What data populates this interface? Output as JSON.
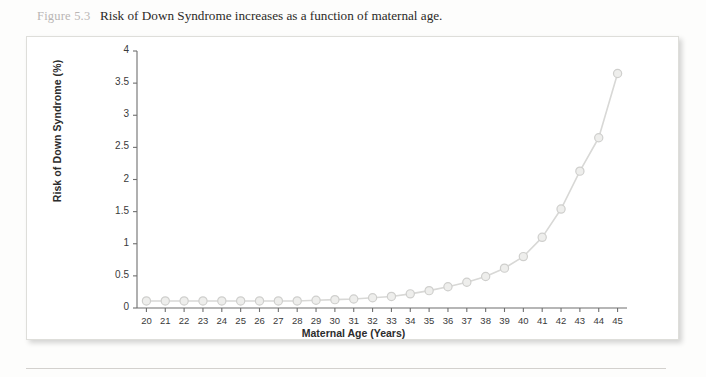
{
  "caption": {
    "figure_number": "Figure 5.3",
    "text": "Risk of Down Syndrome increases as a function of maternal age."
  },
  "colors": {
    "line": "#d8d8d6",
    "marker_fill": "#eeeeec",
    "marker_stroke": "#cfcfcd",
    "axis": "#6f6f6f",
    "text": "#2c2c2c",
    "panel_border": "#dededa",
    "figure_number": "#b9b6b4"
  },
  "chart_data": {
    "type": "line",
    "title": "Risk of Down Syndrome increases as a function of maternal age.",
    "xlabel": "Maternal Age (Years)",
    "ylabel": "Risk of Down Syndrome (%)",
    "xlim": [
      19.5,
      45.5
    ],
    "ylim": [
      0,
      4
    ],
    "grid": false,
    "legend": "none",
    "marker": "circle",
    "x": [
      20,
      21,
      22,
      23,
      24,
      25,
      26,
      27,
      28,
      29,
      30,
      31,
      32,
      33,
      34,
      35,
      36,
      37,
      38,
      39,
      40,
      41,
      42,
      43,
      44,
      45
    ],
    "xtick_labels": [
      "20",
      "21",
      "22",
      "23",
      "24",
      "25",
      "26",
      "27",
      "28",
      "29",
      "30",
      "31",
      "32",
      "33",
      "34",
      "35",
      "36",
      "37",
      "38",
      "39",
      "40",
      "41",
      "42",
      "43",
      "44",
      "45"
    ],
    "ytick_values": [
      0,
      0.5,
      1,
      1.5,
      2,
      2.5,
      3,
      3.5,
      4
    ],
    "ytick_labels": [
      "0",
      "0.5",
      "1",
      "1.5",
      "2",
      "2.5",
      "3",
      "3.5",
      "4"
    ],
    "series": [
      {
        "name": "Risk of Down Syndrome (%)",
        "values": [
          0.11,
          0.11,
          0.11,
          0.11,
          0.11,
          0.11,
          0.11,
          0.11,
          0.11,
          0.12,
          0.13,
          0.14,
          0.16,
          0.18,
          0.22,
          0.27,
          0.33,
          0.4,
          0.49,
          0.62,
          0.8,
          1.1,
          1.54,
          2.13,
          2.65,
          3.65
        ]
      }
    ]
  }
}
